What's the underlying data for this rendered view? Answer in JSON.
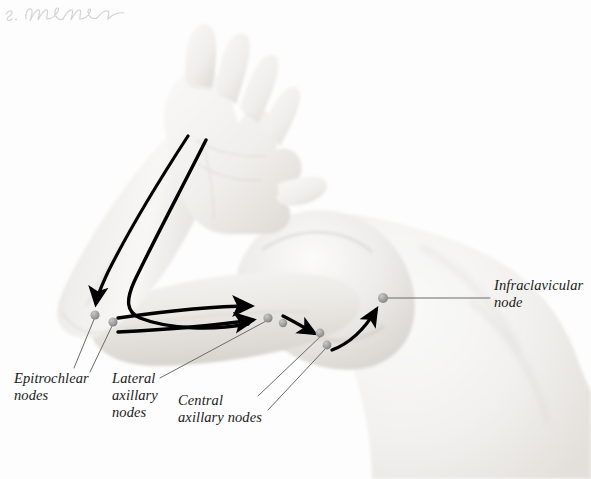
{
  "figure": {
    "domain": "anatomical-illustration",
    "background_color": "#fdfdfd",
    "skin_color": "#e9e7e3",
    "flow_line_color": "#000000",
    "node_color": "#9a9a9a",
    "leader_line_color": "#6b6b6b",
    "label_color": "#1a1a1a"
  },
  "labels": {
    "epitrochlear": "Epitrochlear\nnodes",
    "lateral_axillary": "Lateral\naxillary\nnodes",
    "central_axillary": "Central\naxillary nodes",
    "infraclavicular": "Infraclavicular\nnode"
  },
  "nodes": [
    {
      "name": "epitrochlear-node-upper",
      "x": 95,
      "y": 315
    },
    {
      "name": "epitrochlear-node-lower",
      "x": 113,
      "y": 322
    },
    {
      "name": "lateral-axillary-node-upper",
      "x": 268,
      "y": 318
    },
    {
      "name": "lateral-axillary-node-lower",
      "x": 283,
      "y": 323
    },
    {
      "name": "central-axillary-node-upper",
      "x": 320,
      "y": 333
    },
    {
      "name": "central-axillary-node-lower",
      "x": 327,
      "y": 345
    },
    {
      "name": "infraclavicular-node",
      "x": 383,
      "y": 298
    }
  ],
  "signature": {
    "artist_initial": "S.",
    "artist_surname": "Brown",
    "reading": "S. Dwyer Brown"
  }
}
